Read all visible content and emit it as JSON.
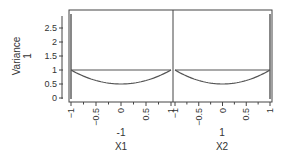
{
  "chart_data": {
    "type": "line",
    "title": "",
    "ylabel": "Variance",
    "ylabel_value": "1",
    "ylim": [
      0,
      3
    ],
    "yticks": [
      "0",
      "0.5",
      "1",
      "1.5",
      "2",
      "2.5"
    ],
    "panels": [
      {
        "xlabel": "X1",
        "xlabel_value": "-1",
        "xlim": [
          -1,
          1
        ],
        "xticks": [
          "-1",
          "-0.5",
          "0",
          "0.5",
          "1"
        ],
        "current_x": -1,
        "series": [
          {
            "name": "variance",
            "x": [
              -1,
              -0.5,
              0,
              0.5,
              1
            ],
            "y": [
              1.0,
              0.625,
              0.5,
              0.625,
              1.0
            ]
          },
          {
            "name": "reference",
            "x": [
              -1,
              1
            ],
            "y": [
              1.0,
              1.0
            ]
          }
        ]
      },
      {
        "xlabel": "X2",
        "xlabel_value": "1",
        "xlim": [
          -1,
          1
        ],
        "xticks": [
          "-1",
          "-0.5",
          "0",
          "0.5",
          "1"
        ],
        "current_x": 1,
        "series": [
          {
            "name": "variance",
            "x": [
              -1,
              -0.5,
              0,
              0.5,
              1
            ],
            "y": [
              1.0,
              0.625,
              0.5,
              0.625,
              1.0
            ]
          },
          {
            "name": "reference",
            "x": [
              -1,
              1
            ],
            "y": [
              1.0,
              1.0
            ]
          }
        ]
      }
    ],
    "grid": false,
    "legend": null
  },
  "labels": {
    "y_axis_title": "Variance",
    "y_axis_value": "1",
    "x1_title": "X1",
    "x1_value": "-1",
    "x2_title": "X2",
    "x2_value": "1"
  },
  "colors": {
    "line": "#555555",
    "frame": "#444444",
    "text": "#333333"
  }
}
